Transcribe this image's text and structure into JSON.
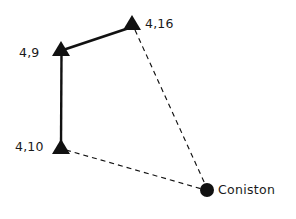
{
  "diagram": {
    "type": "sketch-network-diagram",
    "background_color": "#ffffff",
    "stroke_color": "#111111",
    "nodes": [
      {
        "id": "n-4-16",
        "label": "4,16",
        "marker": "triangle-marker",
        "x": 132,
        "y": 25,
        "label_x": 145,
        "label_y": 18
      },
      {
        "id": "n-4-9",
        "label": "4,9",
        "marker": "triangle-marker",
        "x": 61,
        "y": 51,
        "label_x": 19,
        "label_y": 47
      },
      {
        "id": "n-4-10",
        "label": "4,10",
        "marker": "triangle-marker",
        "x": 61,
        "y": 148,
        "label_x": 15,
        "label_y": 140
      },
      {
        "id": "n-coniston",
        "label": "Coniston",
        "marker": "circle-marker",
        "x": 207,
        "y": 190,
        "label_x": 218,
        "label_y": 183
      }
    ],
    "edges": [
      {
        "id": "edge-4-10-to-4-9",
        "from": "n-4-10",
        "to": "n-4-9",
        "style": "solid",
        "width": 2.4
      },
      {
        "id": "edge-4-9-to-4-16",
        "from": "n-4-9",
        "to": "n-4-16",
        "style": "solid",
        "width": 2.4
      },
      {
        "id": "edge-4-16-to-coniston",
        "from": "n-4-16",
        "to": "n-coniston",
        "style": "dashed",
        "width": 1.1,
        "dash_pattern": "5,4"
      },
      {
        "id": "edge-4-10-to-coniston",
        "from": "n-4-10",
        "to": "n-coniston",
        "style": "dashed",
        "width": 1.1,
        "dash_pattern": "5,4"
      }
    ]
  }
}
